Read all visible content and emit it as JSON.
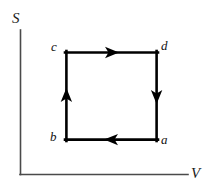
{
  "figure": {
    "background_color": "#ffffff",
    "width": 210,
    "height": 191
  },
  "axes": {
    "vertical": {
      "label": "S",
      "name": "entropy-axis",
      "color": "#4a4a4a",
      "x": 20,
      "y_top": 30,
      "y_bottom": 174
    },
    "horizontal": {
      "label": "V",
      "name": "volume-axis",
      "color": "#4a4a4a",
      "y": 174,
      "x_left": 20,
      "x_right": 188
    }
  },
  "cycle": {
    "name": "rectangular-cycle-path",
    "stroke_color": "#000000",
    "stroke_width": 2.6,
    "rect": {
      "left": 66,
      "top": 52,
      "right": 157,
      "bottom": 140
    },
    "vertices": [
      {
        "id": "a",
        "label": "a",
        "x": 157,
        "y": 140,
        "label_x": 161,
        "label_y": 133
      },
      {
        "id": "b",
        "label": "b",
        "x": 66,
        "y": 140,
        "label_x": 50,
        "label_y": 130
      },
      {
        "id": "c",
        "label": "c",
        "x": 66,
        "y": 52,
        "label_x": 51,
        "label_y": 40
      },
      {
        "id": "d",
        "label": "d",
        "x": 157,
        "y": 52,
        "label_x": 161,
        "label_y": 39
      }
    ],
    "segments": [
      {
        "name": "segment-a-to-b",
        "from": "a",
        "to": "b",
        "direction": "left",
        "arrow_x": 112,
        "arrow_y": 140
      },
      {
        "name": "segment-b-to-c",
        "from": "b",
        "to": "c",
        "direction": "up",
        "arrow_x": 66,
        "arrow_y": 97
      },
      {
        "name": "segment-c-to-d",
        "from": "c",
        "to": "d",
        "direction": "right",
        "arrow_x": 112,
        "arrow_y": 52
      },
      {
        "name": "segment-d-to-a",
        "from": "d",
        "to": "a",
        "direction": "down",
        "arrow_x": 157,
        "arrow_y": 97
      }
    ],
    "sense": "counterclockwise"
  }
}
